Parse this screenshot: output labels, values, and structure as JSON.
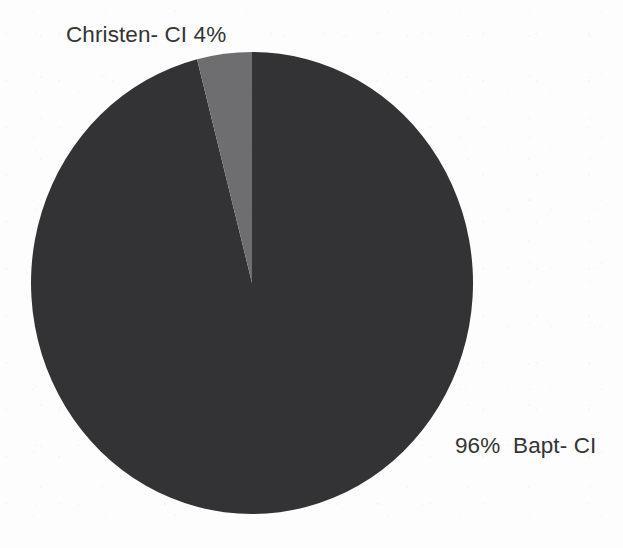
{
  "figure": {
    "background_color": "#fdfdfd",
    "label_text_color": "#343434"
  },
  "labels": {
    "christen": "Christen- CI 4%",
    "bapt": "96%  Bapt- CI"
  },
  "chart_data": {
    "type": "pie",
    "title": "",
    "subtitle": "",
    "xlabel": "",
    "ylabel": "",
    "grid": false,
    "legend_position": "none",
    "label_style": "outside-callout",
    "start_angle_deg": 0,
    "direction": "clockwise",
    "total": 100,
    "units": "%",
    "categories": [
      "Bapt- CI",
      "Christen- CI"
    ],
    "values": [
      96,
      4
    ],
    "colors": [
      "#333335",
      "#6e6e70"
    ],
    "slices": [
      {
        "name": "Bapt- CI",
        "value": 96,
        "percent": "96%",
        "label": "96%  Bapt- CI",
        "color": "#333335",
        "start_angle_deg": 0,
        "end_angle_deg": 345.6
      },
      {
        "name": "Christen- CI",
        "value": 4,
        "percent": "4%",
        "label": "Christen- CI 4%",
        "color": "#6e6e70",
        "start_angle_deg": 345.6,
        "end_angle_deg": 360
      }
    ]
  }
}
